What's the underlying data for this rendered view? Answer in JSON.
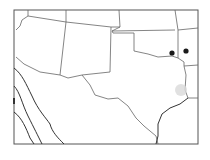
{
  "map": {
    "region": "South-central United States",
    "states_visible": [
      "Arizona",
      "New Mexico",
      "Texas",
      "Oklahoma",
      "Colorado",
      "Kansas",
      "Arkansas",
      "Louisiana",
      "Utah",
      "Missouri"
    ],
    "colors": {
      "background": "#ffffff",
      "border": "#555555",
      "state_line": "#666666",
      "marker": "#1a1a1a",
      "highlight": "#d9d9d9"
    },
    "markers": [
      {
        "id": "marker-1",
        "x": 172,
        "y": 53
      },
      {
        "id": "marker-2",
        "x": 186,
        "y": 51
      }
    ],
    "highlight_area": {
      "x": 181,
      "y": 90
    }
  }
}
